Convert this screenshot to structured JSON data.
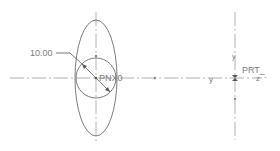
{
  "drawing": {
    "background": "#ffffff",
    "line_color": "#6e6e6e",
    "axis_color": "#9a9a9a",
    "dimension": {
      "text": "10.00"
    },
    "labels": {
      "pnx0": "PNX0",
      "prt": "PRT_",
      "y_axis": "y",
      "z_axis": "z",
      "dash": "-"
    },
    "left_csys": {
      "cx": 96,
      "cy": 78
    },
    "right_csys": {
      "cx": 235,
      "cy": 78
    },
    "circle": {
      "cx": 96,
      "cy": 78,
      "r": 20
    },
    "ellipse": {
      "cx": 96,
      "cy": 78,
      "rx": 21,
      "ry": 58
    }
  }
}
